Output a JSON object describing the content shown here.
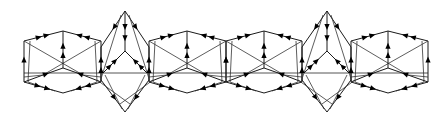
{
  "diagram": {
    "type": "directed-graph-tiling",
    "width": 448,
    "height": 124,
    "colors": {
      "edge": "#1a1a1a",
      "arrow": "#000000",
      "baseline": "#555555",
      "background": "#ffffff"
    },
    "baseline": {
      "y": 73,
      "x1": 24,
      "x2": 428
    },
    "hexagons": [
      {
        "id": "hex-1",
        "cx": 63,
        "cy": 62,
        "left": 24,
        "right": 101,
        "top": 31,
        "bottom": 93,
        "upper": 41,
        "lower": 79
      },
      {
        "id": "hex-2",
        "cx": 187,
        "cy": 62,
        "left": 149,
        "right": 226,
        "top": 31,
        "bottom": 93,
        "upper": 41,
        "lower": 79
      },
      {
        "id": "hex-3",
        "cx": 264,
        "cy": 62,
        "left": 226,
        "right": 302,
        "top": 31,
        "bottom": 93,
        "upper": 41,
        "lower": 79
      },
      {
        "id": "hex-4",
        "cx": 388,
        "cy": 62,
        "left": 351,
        "right": 428,
        "top": 31,
        "bottom": 93,
        "upper": 41,
        "lower": 79
      }
    ],
    "diamonds": [
      {
        "id": "diamond-1",
        "cx": 125,
        "top": 11,
        "bottom": 112,
        "branch": 51,
        "left": 101,
        "right": 149
      },
      {
        "id": "diamond-2",
        "cx": 327,
        "top": 11,
        "bottom": 112,
        "branch": 51,
        "left": 302,
        "right": 351
      }
    ]
  }
}
